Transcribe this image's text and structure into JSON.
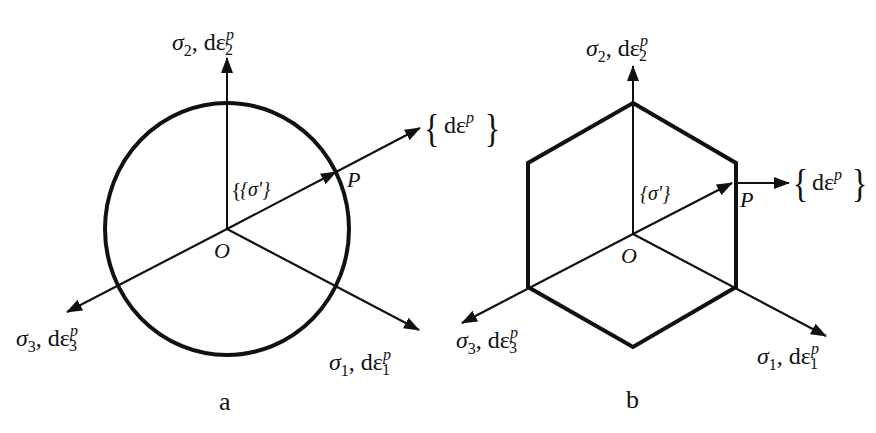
{
  "panels": [
    {
      "id": "a",
      "caption": "a",
      "yield_surface": "circle",
      "origin_label": "O",
      "point_label": "P",
      "stress_vector_label": "{σ'}",
      "flow_vector_label": "dε",
      "flow_vector_sup": "p",
      "axes": [
        {
          "sigma": "σ",
          "sub": "2",
          "strain": "dε",
          "strain_sub": "2",
          "strain_sup": "p"
        },
        {
          "sigma": "σ",
          "sub": "1",
          "strain": "dε",
          "strain_sub": "1",
          "strain_sup": "p"
        },
        {
          "sigma": "σ",
          "sub": "3",
          "strain": "dε",
          "strain_sub": "3",
          "strain_sup": "p"
        }
      ]
    },
    {
      "id": "b",
      "caption": "b",
      "yield_surface": "hexagon",
      "origin_label": "O",
      "point_label": "P",
      "stress_vector_label": "{σ'}",
      "flow_vector_label": "dε",
      "flow_vector_sup": "p",
      "axes": [
        {
          "sigma": "σ",
          "sub": "2",
          "strain": "dε",
          "strain_sub": "2",
          "strain_sup": "p"
        },
        {
          "sigma": "σ",
          "sub": "1",
          "strain": "dε",
          "strain_sub": "1",
          "strain_sup": "p"
        },
        {
          "sigma": "σ",
          "sub": "3",
          "strain": "dε",
          "strain_sub": "3",
          "strain_sup": "p"
        }
      ]
    }
  ],
  "colors": {
    "line": "#111111",
    "background": "#ffffff"
  }
}
